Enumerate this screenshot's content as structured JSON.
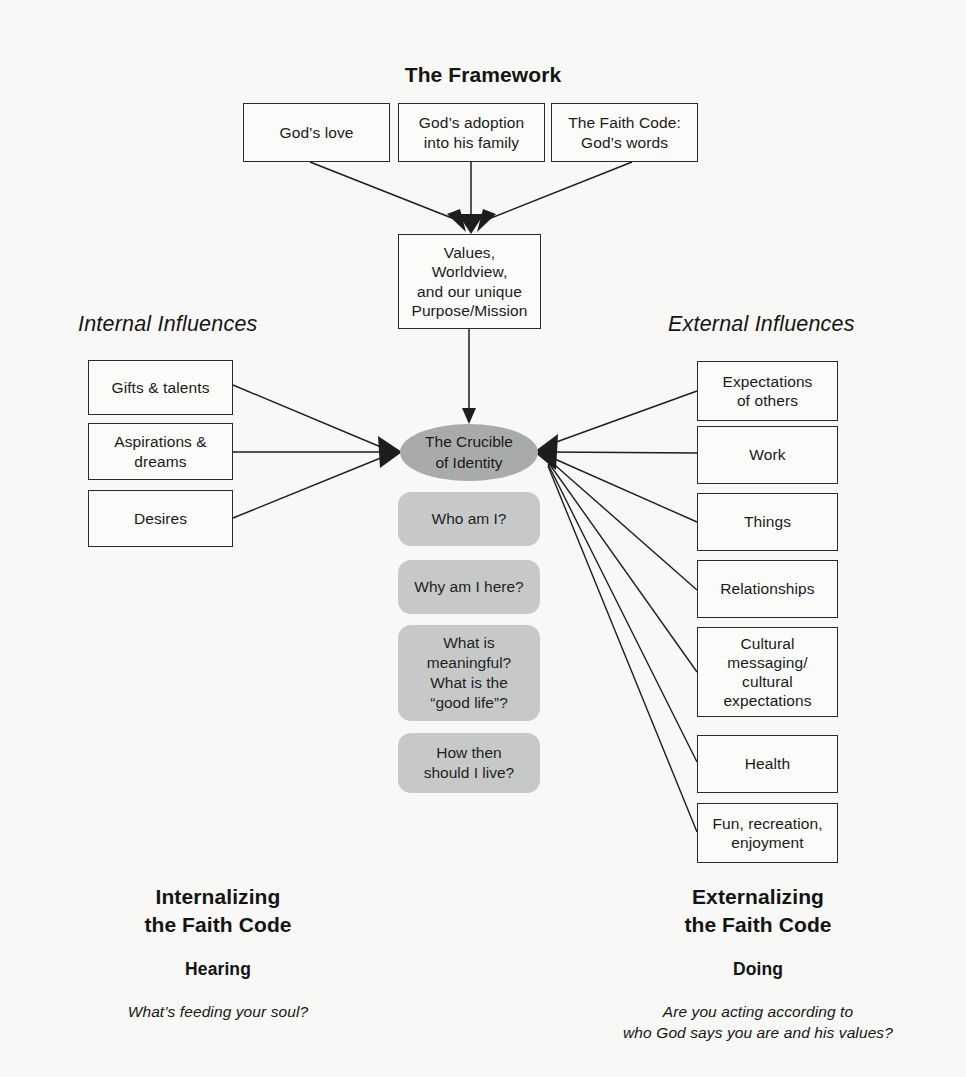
{
  "diagram": {
    "title": "The Framework",
    "section_headings": {
      "left": "Internal Influences",
      "right": "External Influences"
    },
    "colors": {
      "background": "#f8f8f7",
      "box_border": "#2b2b2b",
      "gray_question_box": "#c7c9c9",
      "crucible_ellipse": "#a9abab",
      "edge_line": "#1d1d1d",
      "text": "#1a1a1a"
    },
    "framework_inputs": [
      {
        "id": "gods-love",
        "label": "God’s love"
      },
      {
        "id": "gods-adoption",
        "label": "God’s adoption\ninto his family"
      },
      {
        "id": "faith-code",
        "label": "The Faith Code:\nGod’s words"
      }
    ],
    "values_box": {
      "id": "values-worldview-purpose",
      "label": "Values,\nWorldview,\nand our unique\nPurpose/Mission"
    },
    "crucible": {
      "id": "crucible-of-identity",
      "label": "The Crucible\nof Identity"
    },
    "identity_questions": [
      {
        "id": "who-am-i",
        "label": "Who am I?"
      },
      {
        "id": "why-am-i-here",
        "label": "Why am I here?"
      },
      {
        "id": "what-is-meaningful",
        "label": "What is\nmeaningful?\nWhat is the\n“good life”?"
      },
      {
        "id": "how-should-i-live",
        "label": "How then\nshould I live?"
      }
    ],
    "internal_influences": [
      {
        "id": "gifts-talents",
        "label": "Gifts & talents"
      },
      {
        "id": "aspirations-dreams",
        "label": "Aspirations &\ndreams"
      },
      {
        "id": "desires",
        "label": "Desires"
      }
    ],
    "external_influences": [
      {
        "id": "expectations-of-others",
        "label": "Expectations\nof others"
      },
      {
        "id": "work",
        "label": "Work"
      },
      {
        "id": "things",
        "label": "Things"
      },
      {
        "id": "relationships",
        "label": "Relationships"
      },
      {
        "id": "cultural-messaging",
        "label": "Cultural\nmessaging/\ncultural\nexpectations"
      },
      {
        "id": "health",
        "label": "Health"
      },
      {
        "id": "fun-recreation",
        "label": "Fun, recreation,\nenjoyment"
      }
    ],
    "footer": {
      "left": {
        "title": "Internalizing\nthe Faith Code",
        "subtitle": "Hearing",
        "question": "What’s feeding your soul?"
      },
      "right": {
        "title": "Externalizing\nthe Faith Code",
        "subtitle": "Doing",
        "question": "Are you acting according to\nwho God says you are and his values?"
      }
    }
  }
}
